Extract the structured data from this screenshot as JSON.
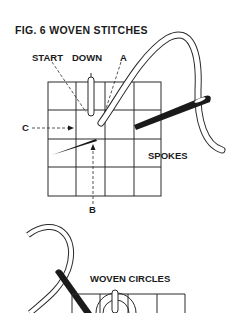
{
  "figure": {
    "title": "FIG. 6   WOVEN STITCHES"
  },
  "labels": {
    "start": "START",
    "down": "DOWN",
    "a": "A",
    "b": "B",
    "c": "C",
    "spokes": "SPOKES",
    "woven_circles": "WOVEN CIRCLES"
  },
  "colors": {
    "ink": "#1a1a1a",
    "paper": "#ffffff"
  }
}
